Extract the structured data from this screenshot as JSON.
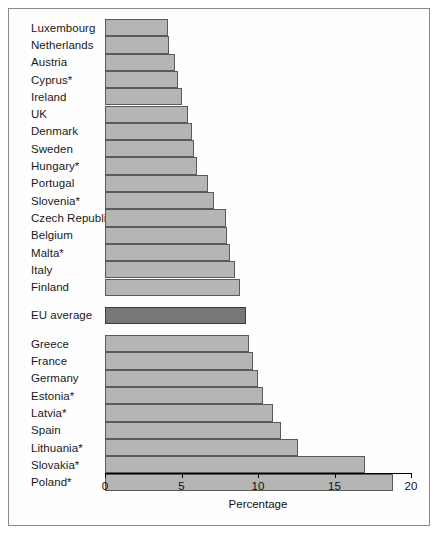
{
  "chart_data": {
    "type": "bar",
    "orientation": "horizontal",
    "title": "",
    "xlabel": "Percentage",
    "ylabel": "",
    "xlim": [
      0,
      20
    ],
    "xticks": [
      0,
      5,
      10,
      15,
      20
    ],
    "grid": false,
    "legend": false,
    "categories": [
      "Luxembourg",
      "Netherlands",
      "Austria",
      "Cyprus*",
      "Ireland",
      "UK",
      "Denmark",
      "Sweden",
      "Hungary*",
      "Portugal",
      "Slovenia*",
      "Czech Republic*",
      "Belgium",
      "Malta*",
      "Italy",
      "Finland",
      "EU average",
      "Greece",
      "France",
      "Germany",
      "Estonia*",
      "Latvia*",
      "Spain",
      "Lithuania*",
      "Slovakia*",
      "Poland*"
    ],
    "values": [
      4.1,
      4.2,
      4.6,
      4.8,
      5.0,
      5.4,
      5.7,
      5.8,
      6.0,
      6.7,
      7.1,
      7.9,
      8.0,
      8.2,
      8.5,
      8.8,
      9.2,
      9.4,
      9.7,
      10.0,
      10.3,
      11.0,
      11.5,
      12.6,
      17.0,
      18.8
    ],
    "groups": [
      {
        "name": "below-average",
        "start": 0,
        "end": 15
      },
      {
        "name": "eu-average",
        "start": 16,
        "end": 16
      },
      {
        "name": "above-average",
        "start": 17,
        "end": 25
      }
    ],
    "colors": {
      "bar": "#b5b5b5",
      "bar_border": "#5a5a5a",
      "eu_average_bar": "#787878",
      "eu_average_border": "#3c3c3c",
      "frame": "#8a8a8a",
      "axis": "#000000",
      "text": "#1a1a1a"
    }
  }
}
